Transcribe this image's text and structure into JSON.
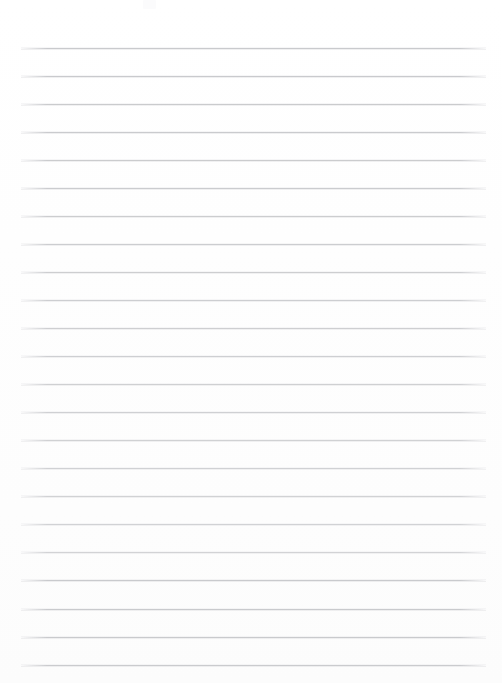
{
  "page": {
    "kind": "ruled-paper-sheet",
    "width": 502,
    "height": 683,
    "background_color": "#fefefe",
    "content_text": "",
    "is_blank": "true"
  },
  "ruling": {
    "line_color": "#c9cacd",
    "line_count": 23,
    "line_thickness_px": 1,
    "first_line_y": 48,
    "line_spacing_px": 28,
    "left_x": 21,
    "right_x": 486,
    "top_margin_px": 48,
    "bottom_margin_px": 18,
    "orientation": "horizontal",
    "has_vertical_margin_rule": "false",
    "lines": [
      {
        "index": 1,
        "y": 48,
        "x1": 21,
        "x2": 486
      },
      {
        "index": 2,
        "y": 76,
        "x1": 21,
        "x2": 486
      },
      {
        "index": 3,
        "y": 104,
        "x1": 21,
        "x2": 486
      },
      {
        "index": 4,
        "y": 132,
        "x1": 21,
        "x2": 486
      },
      {
        "index": 5,
        "y": 160,
        "x1": 21,
        "x2": 486
      },
      {
        "index": 6,
        "y": 188,
        "x1": 21,
        "x2": 486
      },
      {
        "index": 7,
        "y": 216,
        "x1": 21,
        "x2": 486
      },
      {
        "index": 8,
        "y": 244,
        "x1": 21,
        "x2": 486
      },
      {
        "index": 9,
        "y": 272,
        "x1": 21,
        "x2": 486
      },
      {
        "index": 10,
        "y": 300,
        "x1": 21,
        "x2": 486
      },
      {
        "index": 11,
        "y": 328,
        "x1": 21,
        "x2": 486
      },
      {
        "index": 12,
        "y": 356,
        "x1": 21,
        "x2": 486
      },
      {
        "index": 13,
        "y": 384,
        "x1": 21,
        "x2": 486
      },
      {
        "index": 14,
        "y": 412,
        "x1": 21,
        "x2": 486
      },
      {
        "index": 15,
        "y": 440,
        "x1": 21,
        "x2": 486
      },
      {
        "index": 16,
        "y": 468,
        "x1": 21,
        "x2": 486
      },
      {
        "index": 17,
        "y": 496,
        "x1": 21,
        "x2": 486
      },
      {
        "index": 18,
        "y": 524,
        "x1": 21,
        "x2": 486
      },
      {
        "index": 19,
        "y": 552,
        "x1": 21,
        "x2": 486
      },
      {
        "index": 20,
        "y": 580,
        "x1": 21,
        "x2": 486
      },
      {
        "index": 21,
        "y": 609,
        "x1": 21,
        "x2": 486
      },
      {
        "index": 22,
        "y": 637,
        "x1": 21,
        "x2": 486
      },
      {
        "index": 23,
        "y": 665,
        "x1": 21,
        "x2": 486
      }
    ]
  },
  "artifacts": {
    "smudge_color": "#fbfbfc"
  }
}
